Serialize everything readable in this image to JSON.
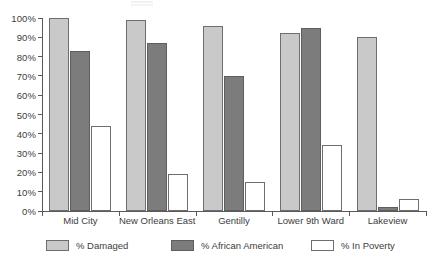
{
  "chart_data": {
    "type": "bar",
    "title": "",
    "subtitle": "",
    "xlabel": "",
    "ylabel": "",
    "ylim": [
      0,
      100
    ],
    "y_tick_labels": [
      "0%",
      "10%",
      "20%",
      "30%",
      "40%",
      "50%",
      "60%",
      "70%",
      "80%",
      "90%",
      "100%"
    ],
    "y_tick_values": [
      0,
      10,
      20,
      30,
      40,
      50,
      60,
      70,
      80,
      90,
      100
    ],
    "grid": false,
    "legend_position": "bottom",
    "categories": [
      "Mid City",
      "New Orleans East",
      "Gentilly",
      "Lower 9th Ward",
      "Lakeview"
    ],
    "series": [
      {
        "name": "% Damaged",
        "color": "#c9c9c9",
        "values": [
          100,
          99,
          96,
          92,
          90
        ]
      },
      {
        "name": "% African American",
        "color": "#7c7c7c",
        "values": [
          83,
          87,
          70,
          95,
          2
        ]
      },
      {
        "name": "% In Poverty",
        "color": "#ffffff",
        "values": [
          44,
          19,
          15,
          34,
          6
        ]
      }
    ]
  },
  "legend": {
    "items": [
      {
        "label": "% Damaged",
        "series": 0
      },
      {
        "label": "% African American",
        "series": 1
      },
      {
        "label": "% In Poverty",
        "series": 2
      }
    ]
  }
}
